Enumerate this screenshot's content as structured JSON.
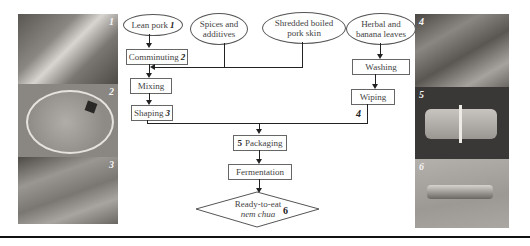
{
  "figure": {
    "left_photos": [
      {
        "number": "1",
        "subject": "lean pork",
        "color": "#6e6a66"
      },
      {
        "number": "2",
        "subject": "comminuted meat in bowl",
        "color": "#8c8884"
      },
      {
        "number": "3",
        "subject": "shaping on leaves",
        "color": "#7a7672"
      }
    ],
    "right_photos": [
      {
        "number": "4",
        "subject": "herbal and banana leaves",
        "color": "#5e5a56"
      },
      {
        "number": "5",
        "subject": "packaged roll",
        "color": "#3a3836"
      },
      {
        "number": "6",
        "subject": "fermented nem chua",
        "color": "#a09c98"
      }
    ],
    "inputs": {
      "lean_pork": "Lean pork",
      "lean_pork_num": "1",
      "spices": "Spices and additives",
      "pork_skin": "Shredded boiled pork skin",
      "leaves": "Herbal and banana leaves"
    },
    "steps": {
      "comminuting": "Comminuting",
      "comminuting_num": "2",
      "mixing": "Mixing",
      "shaping": "Shaping",
      "shaping_num": "3",
      "washing": "Washing",
      "wiping": "Wiping",
      "leaves_num": "4",
      "packaging_num": "5",
      "packaging": "Packaging",
      "fermentation": "Fermentation",
      "product_line1": "Ready-to-eat",
      "product_line2": "nem chua",
      "product_num": "6"
    }
  }
}
